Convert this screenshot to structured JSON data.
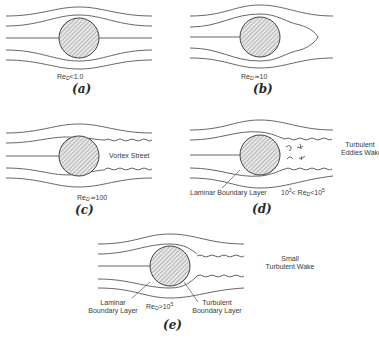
{
  "figure": {
    "panels": [
      {
        "id": "a",
        "label": "(a)",
        "re_prefix": "Re",
        "re_sub": "D",
        "re_relation": "<1.0",
        "annotations": []
      },
      {
        "id": "b",
        "label": "(b)",
        "re_prefix": "Re",
        "re_sub": "D",
        "re_relation": "≃10",
        "annotations": []
      },
      {
        "id": "c",
        "label": "(c)",
        "re_prefix": "Re",
        "re_sub": "D",
        "re_relation": "≃100",
        "annotations": [
          "Vortex Street"
        ]
      },
      {
        "id": "d",
        "label": "(d)",
        "re_lower": "10",
        "re_lower_exp": "3",
        "re_mid": "< Re",
        "re_sub": "D",
        "re_upper": "<10",
        "re_upper_exp": "5",
        "annotations": [
          "Turbulent",
          "Eddies Wake",
          "Laminar Boundary Layer"
        ]
      },
      {
        "id": "e",
        "label": "(e)",
        "re_prefix": "Re",
        "re_sub": "D",
        "re_relation": ">10",
        "re_exp": "5",
        "annotations": [
          "Small",
          "Turbulent Wake",
          "Laminar",
          "Boundary Layer",
          "Turbulent",
          "Boundary Layer"
        ]
      }
    ]
  }
}
